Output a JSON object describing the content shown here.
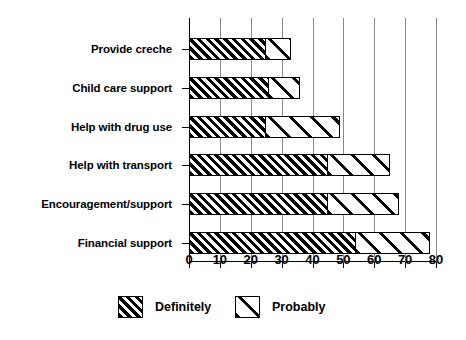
{
  "chart_data": {
    "type": "bar",
    "orientation": "horizontal",
    "stacked": true,
    "title": "",
    "subtitle": "",
    "xlabel": "",
    "ylabel": "",
    "xlim": [
      0,
      80
    ],
    "ylim": null,
    "grid": "vertical-gridlines-at-each-xtick",
    "legend_position": "bottom-center",
    "categories": [
      "Provide creche",
      "Child care support",
      "Help with drug use",
      "Help with transport",
      "Encouragement/support",
      "Financial support"
    ],
    "xticks": [
      0,
      10,
      20,
      30,
      40,
      50,
      60,
      70,
      80
    ],
    "xtick_labels": [
      "0",
      "10",
      "20",
      "30",
      "40",
      "50",
      "60",
      "70",
      "80"
    ],
    "series": [
      {
        "name": "Definitely",
        "pattern": "dense-diagonal-hatch-black",
        "color": "#000000",
        "values": [
          25,
          26,
          25,
          45,
          45,
          54
        ]
      },
      {
        "name": "Probably",
        "pattern": "sparse-diagonal-hatch-white",
        "color": "#ffffff",
        "values": [
          8,
          10,
          24,
          20,
          23,
          24
        ]
      }
    ],
    "totals": [
      33,
      36,
      49,
      65,
      68,
      78
    ]
  },
  "legend": {
    "items": [
      {
        "label": "Definitely",
        "swatch": "dense-hatch-swatch"
      },
      {
        "label": "Probably",
        "swatch": "sparse-hatch-swatch"
      }
    ]
  },
  "colors": {
    "background": "#ffffff",
    "axis": "#000000",
    "gridline": "#8a8a8a",
    "bar_outline": "#000000"
  }
}
